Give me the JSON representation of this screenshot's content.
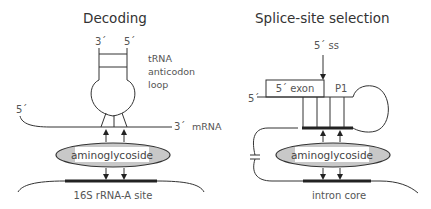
{
  "panels": {
    "decoding": {
      "title": "Decoding",
      "trna_3prime": "3´",
      "trna_5prime": "5´",
      "trna_label": [
        "tRNA",
        "anticodon",
        "loop"
      ],
      "mrna_5prime": "5´",
      "mrna_3prime": "3´",
      "mrna_label": "mRNA",
      "drug_label": "aminoglycoside",
      "target_label": "16S  rRNA-A  site"
    },
    "splice": {
      "title": "Splice-site  selection",
      "ss_label": "5´ ss",
      "exon_label": "5´ exon",
      "p1_label": "P1",
      "strand_5prime": "5´",
      "drug_label": "aminoglycoside",
      "target_label": "intron  core"
    }
  },
  "colors": {
    "ellipse_fill": "#c8c8c8",
    "line": "#333333",
    "text": "#555555"
  }
}
